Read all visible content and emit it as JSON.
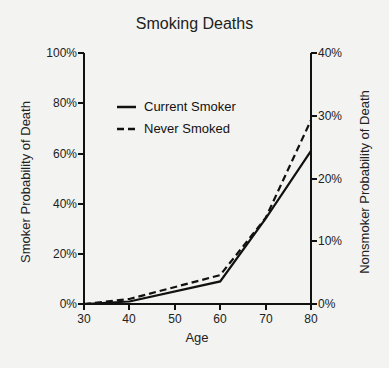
{
  "chart_data": {
    "type": "line",
    "title": "Smoking Deaths",
    "xlabel": "Age",
    "ylabel": "Smoker Probability of Death",
    "ylabel_right": "Nonsmoker Probability of Death",
    "x": [
      30,
      40,
      60,
      70,
      80
    ],
    "xticks": [
      "30",
      "40",
      "50",
      "60",
      "70",
      "80"
    ],
    "xlim": [
      30,
      80
    ],
    "ylim": [
      0,
      100
    ],
    "ylim_right": [
      0,
      40
    ],
    "yticks_left": [
      "0%",
      "20%",
      "40%",
      "60%",
      "80%",
      "100%"
    ],
    "yticks_right": [
      "0%",
      "10%",
      "20%",
      "30%",
      "40%"
    ],
    "grid": false,
    "legend_position": "upper left inside",
    "series": [
      {
        "name": "Current Smoker",
        "axis": "left",
        "style": "solid",
        "x": [
          30,
          40,
          60,
          70,
          80
        ],
        "values": [
          0,
          1,
          9,
          34,
          61
        ]
      },
      {
        "name": "Never Smoked",
        "axis": "right",
        "style": "dashed",
        "x": [
          30,
          40,
          60,
          70,
          80
        ],
        "values": [
          0,
          0.8,
          4.6,
          13.7,
          29.3
        ]
      }
    ]
  },
  "labels": {
    "title": "Smoking Deaths",
    "xlabel": "Age",
    "ylabel_left": "Smoker Probability of Death",
    "ylabel_right": "Nonsmoker Probability of Death",
    "legend_solid": "Current Smoker",
    "legend_dashed": "Never Smoked",
    "yl": [
      "0%",
      "20%",
      "40%",
      "60%",
      "80%",
      "100%"
    ],
    "yr": [
      "0%",
      "10%",
      "20%",
      "30%",
      "40%"
    ],
    "xt": [
      "30",
      "40",
      "50",
      "60",
      "70",
      "80"
    ]
  }
}
